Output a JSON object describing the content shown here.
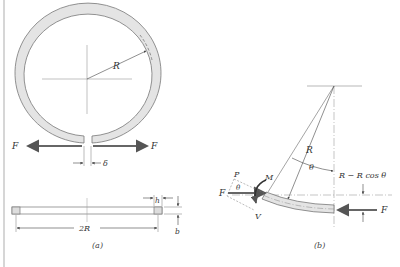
{
  "figure": {
    "frame_color": "#bbbbbb",
    "ring_fill": "#e4e4e4",
    "line_color": "#666666",
    "arrow_color": "#555555"
  },
  "panel_a": {
    "caption": "(a)",
    "labels": {
      "radius": "R",
      "force_left": "F",
      "force_right": "F",
      "gap": "δ",
      "diameter": "2R",
      "thickness": "h",
      "width": "b"
    }
  },
  "panel_b": {
    "caption": "(b)",
    "labels": {
      "radius": "R",
      "angle": "θ",
      "angle_small": "θ",
      "offset": "R − R cos θ",
      "axial": "P",
      "moment": "M",
      "shear": "V",
      "force_left": "F",
      "force_right": "F"
    }
  }
}
